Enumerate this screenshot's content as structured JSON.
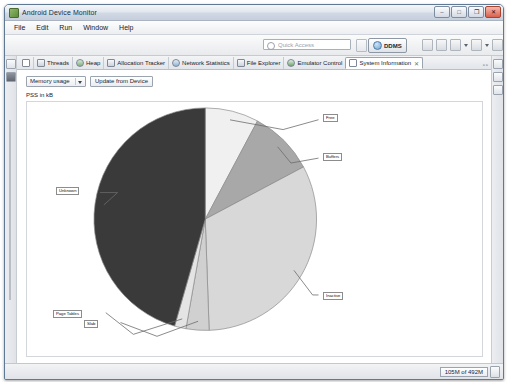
{
  "window": {
    "title": "Android Device Monitor",
    "icon": "android-icon",
    "controls": [
      {
        "name": "minimize-button",
        "glyph": "–"
      },
      {
        "name": "maximize-button",
        "glyph": "□"
      },
      {
        "name": "restore-button",
        "glyph": "❐"
      },
      {
        "name": "close-button",
        "glyph": "✕"
      }
    ]
  },
  "menubar": {
    "items": [
      {
        "label": "File",
        "name": "menu-file"
      },
      {
        "label": "Edit",
        "name": "menu-edit"
      },
      {
        "label": "Run",
        "name": "menu-run"
      },
      {
        "label": "Window",
        "name": "menu-window"
      },
      {
        "label": "Help",
        "name": "menu-help"
      }
    ]
  },
  "toolbar": {
    "quick_access_placeholder": "Quick Access",
    "quick_access_value": "",
    "perspective_label": "DDMS",
    "icons": [
      "lock-icon",
      "save-icon",
      "run-icon",
      "caret-down-icon",
      "debug-icon",
      "caret-down-icon",
      "link-icon",
      "search-icon",
      "caret-down-icon"
    ]
  },
  "tabs": [
    {
      "label": "",
      "name": "tab-overflow-marker",
      "icon": "hash-icon",
      "active": false,
      "closable": false
    },
    {
      "label": "Threads",
      "name": "tab-threads",
      "icon": "threads-icon",
      "active": false,
      "closable": false
    },
    {
      "label": "Heap",
      "name": "tab-heap",
      "icon": "heap-icon",
      "active": false,
      "closable": false
    },
    {
      "label": "Allocation Tracker",
      "name": "tab-allocation-tracker",
      "icon": "allocation-icon",
      "active": false,
      "closable": false
    },
    {
      "label": "Network Statistics",
      "name": "tab-network-statistics",
      "icon": "network-icon",
      "active": false,
      "closable": false
    },
    {
      "label": "File Explorer",
      "name": "tab-file-explorer",
      "icon": "folder-icon",
      "active": false,
      "closable": false
    },
    {
      "label": "Emulator Control",
      "name": "tab-emulator-control",
      "icon": "emulator-icon",
      "active": false,
      "closable": false
    },
    {
      "label": "System Information",
      "name": "tab-system-information",
      "icon": "sysinfo-icon",
      "active": true,
      "closable": true
    }
  ],
  "tab_close_glyph": "✕",
  "tab_overflow_glyph": "▫▫",
  "view": {
    "select_value": "Memory usage",
    "select_options": [
      "Memory usage",
      "CPU load",
      "Frame Render Time"
    ],
    "update_button_label": "Update from Device",
    "units_label": "PSS in kB"
  },
  "chart_data": {
    "type": "pie",
    "title": "",
    "unit_label": "PSS in kB",
    "legend_position": "callout-labels",
    "categories": [
      "Free",
      "Buffers",
      "Inactive",
      "Slab",
      "Page Tables",
      "Unknown"
    ],
    "values": [
      7.0,
      8.5,
      29.0,
      3.0,
      1.5,
      41.0
    ],
    "colors": [
      "#f0f0f0",
      "#a8a8a8",
      "#d8d8d8",
      "#d0d0d0",
      "#e4e4e4",
      "#3a3a3a"
    ],
    "start_angle_deg": 0,
    "direction": "clockwise",
    "labels": [
      {
        "text": "Free",
        "name": "pie-label-free"
      },
      {
        "text": "Buffers",
        "name": "pie-label-buffers"
      },
      {
        "text": "Inactive",
        "name": "pie-label-inactive"
      },
      {
        "text": "Slab",
        "name": "pie-label-slab"
      },
      {
        "text": "Page Tables",
        "name": "pie-label-page-tables"
      },
      {
        "text": "Unknown",
        "name": "pie-label-unknown"
      }
    ]
  },
  "statusbar": {
    "heap_status": "105M of 492M",
    "trash_icon": "trash-icon"
  }
}
